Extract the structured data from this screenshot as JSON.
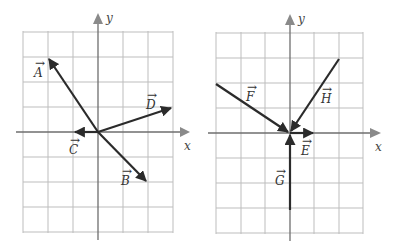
{
  "diagrams": [
    {
      "name": "left-grid",
      "axis_labels": {
        "x": "x",
        "y": "y"
      },
      "grid": {
        "x_range": [
          -3,
          3
        ],
        "y_range": [
          -4,
          4
        ]
      },
      "vectors": [
        {
          "label": "A",
          "tail": [
            0,
            0
          ],
          "head": [
            -2,
            3
          ]
        },
        {
          "label": "B",
          "tail": [
            0,
            0
          ],
          "head": [
            2,
            -2
          ]
        },
        {
          "label": "C",
          "tail": [
            0,
            0
          ],
          "head": [
            -1,
            0
          ]
        },
        {
          "label": "D",
          "tail": [
            0,
            0
          ],
          "head": [
            3,
            1
          ]
        }
      ]
    },
    {
      "name": "right-grid",
      "axis_labels": {
        "x": "x",
        "y": "y"
      },
      "grid": {
        "x_range": [
          -3,
          3
        ],
        "y_range": [
          -4,
          4
        ]
      },
      "vectors": [
        {
          "label": "E",
          "tail": [
            0,
            0
          ],
          "head": [
            1,
            0
          ]
        },
        {
          "label": "F",
          "tail": [
            -3,
            2
          ],
          "head": [
            0,
            0
          ]
        },
        {
          "label": "G",
          "tail": [
            0,
            -3
          ],
          "head": [
            0,
            0
          ]
        },
        {
          "label": "H",
          "tail": [
            2,
            3
          ],
          "head": [
            0,
            0
          ]
        }
      ]
    }
  ],
  "labels": {
    "A": "A",
    "B": "B",
    "C": "C",
    "D": "D",
    "E": "E",
    "F": "F",
    "G": "G",
    "H": "H",
    "x_left": "x",
    "y_left": "y",
    "x_right": "x",
    "y_right": "y"
  },
  "colors": {
    "grid": "#bdbdbd",
    "axis": "#6e6e6e",
    "vector": "#2b2b2b",
    "background": "#ffffff"
  }
}
